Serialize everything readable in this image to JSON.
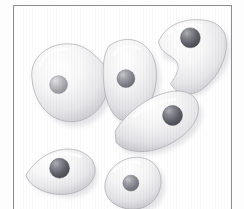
{
  "figure": {
    "title": "Micrograph illustration of amoeboid cells",
    "caption": "",
    "width": 244,
    "height": 209,
    "background_color": "#ffffff",
    "frame": {
      "border_color": "#8c8c90",
      "border_width": 1,
      "x": 13,
      "y": 5,
      "width": 219,
      "height": 206,
      "fill_color": "#ffffff"
    },
    "palette": {
      "cell_highlight": "#ffffff",
      "cell_midtone": "#ececed",
      "cell_shadow": "#b9b9bd",
      "cell_outline": "#a9a9ae",
      "nucleus_light": "#b4b4b8",
      "nucleus_mid": "#7e7e84",
      "nucleus_dark": "#4e4e55",
      "drop_shadow": "#cfcfd4"
    },
    "cell_count": 6,
    "cells": [
      {
        "id": "cell-top-left",
        "label": "Cell 1",
        "shape": "irregular amoeboid blob",
        "center_x": 58,
        "center_y": 78,
        "width": 66,
        "height": 68,
        "rotation_deg": -8,
        "nucleus": {
          "center_x": 54,
          "center_y": 83,
          "radius": 9,
          "tone": "light"
        }
      },
      {
        "id": "cell-top-middle",
        "label": "Cell 2",
        "shape": "elongated oval",
        "center_x": 125,
        "center_y": 72,
        "width": 50,
        "height": 76,
        "rotation_deg": 12,
        "nucleus": {
          "center_x": 124,
          "center_y": 77,
          "radius": 9,
          "tone": "mid"
        }
      },
      {
        "id": "cell-top-right",
        "label": "Cell 3",
        "shape": "kidney bean with concave notch",
        "center_x": 190,
        "center_y": 48,
        "width": 76,
        "height": 72,
        "rotation_deg": -4,
        "nucleus": {
          "center_x": 191,
          "center_y": 36,
          "radius": 10,
          "tone": "dark"
        }
      },
      {
        "id": "cell-middle-right",
        "label": "Cell 4",
        "shape": "tapered wedge pointing left",
        "center_x": 160,
        "center_y": 120,
        "width": 82,
        "height": 58,
        "rotation_deg": -18,
        "nucleus": {
          "center_x": 172,
          "center_y": 114,
          "radius": 10,
          "tone": "dark"
        }
      },
      {
        "id": "cell-bottom-left",
        "label": "Cell 5",
        "shape": "teardrop pointing left",
        "center_x": 55,
        "center_y": 167,
        "width": 68,
        "height": 48,
        "rotation_deg": -6,
        "nucleus": {
          "center_x": 57,
          "center_y": 167,
          "radius": 10,
          "tone": "dark"
        }
      },
      {
        "id": "cell-bottom-middle",
        "label": "Cell 6",
        "shape": "rounded diamond",
        "center_x": 130,
        "center_y": 182,
        "width": 56,
        "height": 52,
        "rotation_deg": 8,
        "nucleus": {
          "center_x": 131,
          "center_y": 182,
          "radius": 8,
          "tone": "mid"
        }
      }
    ]
  }
}
